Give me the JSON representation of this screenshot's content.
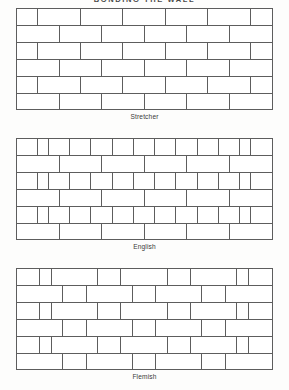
{
  "page": {
    "title": "BONDING THE WALL",
    "line_color": "#5d5d5d",
    "brick_face_color": "#ffffff",
    "background_color": "#fdfdfc"
  },
  "figures": [
    {
      "id": "stretcher",
      "caption": "Stretcher",
      "description": "Stretcher bond: every course laid as stretchers, each course offset by half a brick.",
      "courses": [
        {
          "bricks": [
            0.5,
            1,
            1,
            1,
            1,
            1,
            0.5
          ]
        },
        {
          "bricks": [
            1,
            1,
            1,
            1,
            1,
            1
          ]
        },
        {
          "bricks": [
            0.5,
            1,
            1,
            1,
            1,
            1,
            0.5
          ]
        },
        {
          "bricks": [
            1,
            1,
            1,
            1,
            1,
            1
          ]
        },
        {
          "bricks": [
            0.5,
            1,
            1,
            1,
            1,
            1,
            0.5
          ]
        },
        {
          "bricks": [
            1,
            1,
            1,
            1,
            1,
            1
          ]
        }
      ]
    },
    {
      "id": "english",
      "caption": "English",
      "description": "English bond: alternating courses of headers and stretchers, with queen closers next to the quoins.",
      "courses": [
        {
          "bricks": [
            0.5,
            0.25,
            0.5,
            0.5,
            0.5,
            0.5,
            0.5,
            0.5,
            0.5,
            0.5,
            0.5,
            0.25,
            0.5
          ]
        },
        {
          "bricks": [
            1,
            1,
            1,
            1,
            1,
            1
          ]
        },
        {
          "bricks": [
            0.5,
            0.25,
            0.5,
            0.5,
            0.5,
            0.5,
            0.5,
            0.5,
            0.5,
            0.5,
            0.5,
            0.25,
            0.5
          ]
        },
        {
          "bricks": [
            1,
            1,
            1,
            1,
            1,
            1
          ]
        },
        {
          "bricks": [
            0.5,
            0.25,
            0.5,
            0.5,
            0.5,
            0.5,
            0.5,
            0.5,
            0.5,
            0.5,
            0.5,
            0.25,
            0.5
          ]
        },
        {
          "bricks": [
            1,
            1,
            1,
            1,
            1,
            1
          ]
        }
      ]
    },
    {
      "id": "flemish",
      "caption": "Flemish",
      "description": "Flemish bond: headers and stretchers alternate within every course.",
      "courses": [
        {
          "bricks": [
            0.5,
            0.25,
            1,
            0.5,
            1,
            0.5,
            1,
            0.25,
            0.5
          ]
        },
        {
          "bricks": [
            1,
            0.5,
            1,
            0.5,
            1,
            0.5,
            1
          ]
        },
        {
          "bricks": [
            0.5,
            0.25,
            1,
            0.5,
            1,
            0.5,
            1,
            0.25,
            0.5
          ]
        },
        {
          "bricks": [
            1,
            0.5,
            1,
            0.5,
            1,
            0.5,
            1
          ]
        },
        {
          "bricks": [
            0.5,
            0.25,
            1,
            0.5,
            1,
            0.5,
            1,
            0.25,
            0.5
          ]
        },
        {
          "bricks": [
            1,
            0.5,
            1,
            0.5,
            1,
            0.5,
            1
          ]
        }
      ]
    }
  ]
}
